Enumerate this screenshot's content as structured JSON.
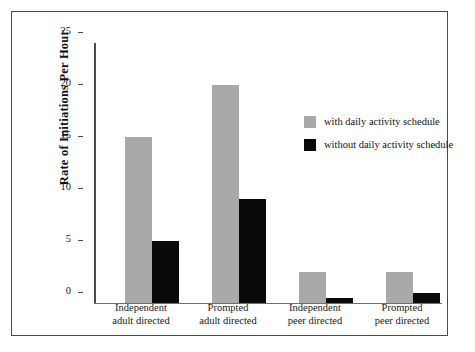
{
  "chart_data": {
    "type": "bar",
    "title": "",
    "xlabel": "",
    "ylabel": "Rate of Initiations Per Hour",
    "ylim": [
      0,
      25
    ],
    "yticks": [
      0,
      5,
      10,
      15,
      20,
      25
    ],
    "ytick_labels": [
      "0",
      "5",
      "10",
      "15",
      "20",
      "25"
    ],
    "grid": false,
    "legend_position": "center-right",
    "categories": [
      "Independent\nadult directed",
      "Prompted\nadult directed",
      "Independent\npeer directed",
      "Prompted\npeer directed"
    ],
    "category_lines": [
      [
        "Independent",
        "adult directed"
      ],
      [
        "Prompted",
        "adult directed"
      ],
      [
        "Independent",
        "peer directed"
      ],
      [
        "Prompted",
        "peer directed"
      ]
    ],
    "series": [
      {
        "name": "with daily activity schedule",
        "color": "#a9a9a9",
        "values": [
          16,
          21,
          3,
          3
        ]
      },
      {
        "name": "without daily activity schedule",
        "color": "#090909",
        "values": [
          6,
          10,
          0.5,
          1
        ]
      }
    ]
  },
  "legend": {
    "items": [
      {
        "label": "with daily activity schedule",
        "color": "#a9a9a9"
      },
      {
        "label": "without daily activity schedule",
        "color": "#090909"
      }
    ]
  },
  "colors": {
    "frame": "#4a4a4a",
    "axis": "#4a4a4a",
    "background": "#ffffff",
    "series_gray": "#a9a9a9",
    "series_black": "#090909"
  }
}
